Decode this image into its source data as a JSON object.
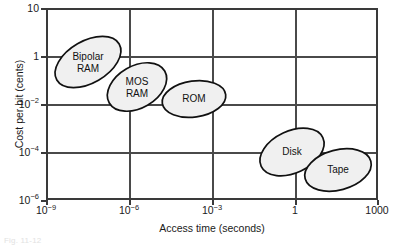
{
  "chart_data": {
    "type": "scatter",
    "title": "",
    "xlabel": "Access time (seconds)",
    "ylabel": "Cost per bit (cents)",
    "xscale": "log",
    "yscale": "log",
    "xlim": [
      1e-09,
      1000
    ],
    "ylim": [
      1e-06,
      10
    ],
    "grid": true,
    "legend": "none",
    "xticks": [
      {
        "value": 1e-09,
        "label_mantissa": "10",
        "label_exponent": "−9"
      },
      {
        "value": 1e-06,
        "label_mantissa": "10",
        "label_exponent": "−6"
      },
      {
        "value": 0.001,
        "label_mantissa": "10",
        "label_exponent": "−3"
      },
      {
        "value": 1,
        "label_mantissa": "1",
        "label_exponent": ""
      },
      {
        "value": 1000,
        "label_mantissa": "1000",
        "label_exponent": ""
      }
    ],
    "yticks": [
      {
        "value": 10,
        "label_mantissa": "10",
        "label_exponent": ""
      },
      {
        "value": 1,
        "label_mantissa": "1",
        "label_exponent": ""
      },
      {
        "value": 0.01,
        "label_mantissa": "10",
        "label_exponent": "−2"
      },
      {
        "value": 0.0001,
        "label_mantissa": "10",
        "label_exponent": "−4"
      },
      {
        "value": 1e-06,
        "label_mantissa": "10",
        "label_exponent": "−6"
      }
    ],
    "regions": [
      {
        "name": "Bipolar RAM",
        "label": "Bipolar\nRAM",
        "access_time_range": [
          1e-09,
          2e-07
        ],
        "cost_per_bit_range": [
          0.1,
          3
        ],
        "cx": 88,
        "cy": 62,
        "rx": 36,
        "ry": 21,
        "rotation": -30
      },
      {
        "name": "MOS RAM",
        "label": "MOS\nRAM",
        "access_time_range": [
          5e-08,
          3e-06
        ],
        "cost_per_bit_range": [
          0.01,
          0.6
        ],
        "cx": 137,
        "cy": 87,
        "rx": 32,
        "ry": 21,
        "rotation": -30
      },
      {
        "name": "ROM",
        "label": "ROM",
        "access_time_range": [
          3e-07,
          2e-05
        ],
        "cost_per_bit_range": [
          0.003,
          0.06
        ],
        "cx": 194,
        "cy": 99,
        "rx": 32,
        "ry": 18,
        "rotation": -8
      },
      {
        "name": "Disk",
        "label": "Disk",
        "access_time_range": [
          0.001,
          3
        ],
        "cost_per_bit_range": [
          1e-05,
          0.001
        ],
        "cx": 292,
        "cy": 152,
        "rx": 34,
        "ry": 21,
        "rotation": -25
      },
      {
        "name": "Tape",
        "label": "Tape",
        "access_time_range": [
          0.3,
          600
        ],
        "cost_per_bit_range": [
          3e-06,
          0.0002
        ],
        "cx": 338,
        "cy": 170,
        "rx": 34,
        "ry": 20,
        "rotation": -15
      }
    ],
    "styles": {
      "bubble_fill": "#f0f0f0",
      "bubble_stroke": "#111111",
      "axis_color": "#3a3a3a",
      "grid_color": "#4a4a4a",
      "text_color": "#1a1a1a"
    }
  },
  "figure": {
    "caption": "Fig. 11-12"
  }
}
